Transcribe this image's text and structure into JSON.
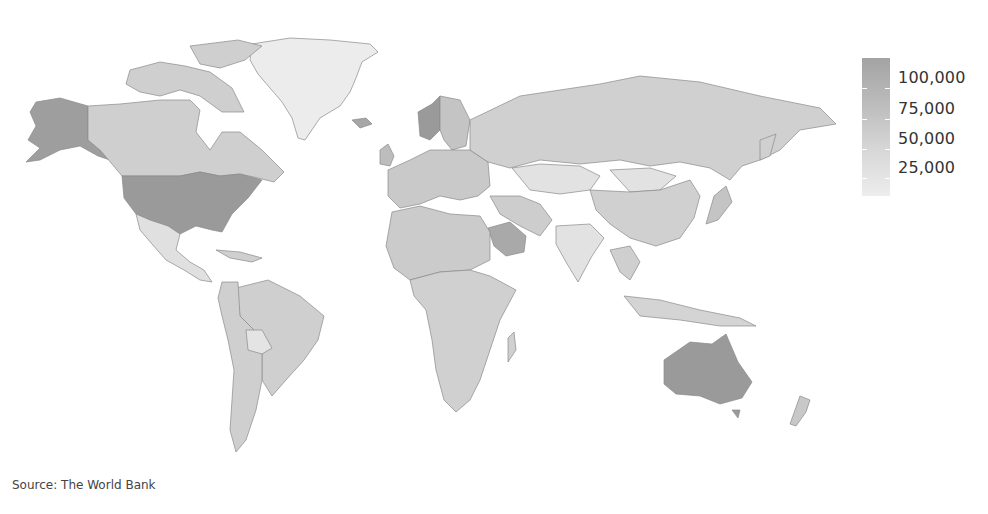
{
  "map": {
    "type": "choropleth",
    "projection": "world",
    "color_scheme": "grayscale",
    "colors": {
      "highest": "#9a9a9a",
      "high": "#b3b3b3",
      "mid": "#cfcfcf",
      "low": "#e0e0e0",
      "lowest": "#ececec",
      "border": "#8a8a8a",
      "water": "#ffffff"
    },
    "legend": {
      "labels": [
        "100,000",
        "75,000",
        "50,000",
        "25,000"
      ],
      "values": [
        100000,
        75000,
        50000,
        25000
      ]
    },
    "highlighted_dark_regions": [
      "United States",
      "Alaska",
      "Australia",
      "Norway",
      "Saudi Arabia",
      "Iceland"
    ],
    "highlighted_light_regions": [
      "Greenland",
      "Mongolia",
      "Kazakhstan",
      "Bolivia",
      "India"
    ]
  },
  "footer": {
    "source": "Source: The World Bank"
  }
}
